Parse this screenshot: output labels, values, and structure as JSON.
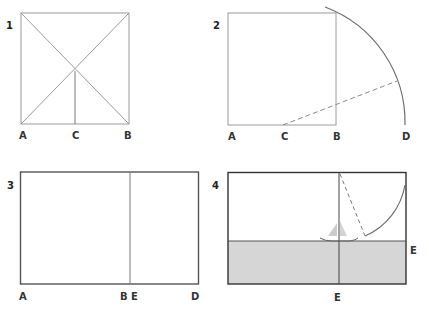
{
  "panels": [
    {
      "number": "1",
      "labels": {
        "a": "A",
        "c": "C",
        "b": "B"
      },
      "description": "Square with both diagonals; vertical line from diagonal intersection down to midpoint C of base AB"
    },
    {
      "number": "2",
      "labels": {
        "a": "A",
        "c": "C",
        "b": "B",
        "d": "D"
      },
      "description": "Square; arc centered at C swinging from top-right corner down to D on extended baseline; dashed radius line"
    },
    {
      "number": "3",
      "labels": {
        "a": "A",
        "be": "B E",
        "d": "D"
      },
      "description": "Golden rectangle AD divided at BE into square and smaller rectangle"
    },
    {
      "number": "4",
      "labels": {
        "e_right": "E",
        "e_bottom": "E"
      },
      "description": "Golden rectangle with horizon line and vertical line at E; shaded sea; arc and dashed line; small sailboat at intersection"
    }
  ],
  "colors": {
    "line": "#8a8a8a",
    "frame": "#555555",
    "arc": "#6e6e6e",
    "sea": "#d6d6d6",
    "sail": "#c8c8c8"
  }
}
